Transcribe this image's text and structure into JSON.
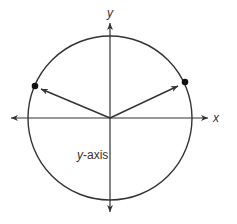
{
  "diagram": {
    "colors": {
      "stroke": "#333333",
      "point": "#111111",
      "background": "#ffffff"
    },
    "axes": {
      "x_label": "x",
      "y_label": "y"
    },
    "circle": {
      "center": [
        110,
        118
      ],
      "radius": 82
    },
    "points": [
      {
        "name": "right-point",
        "position": [
          185,
          82
        ],
        "quadrant": "I"
      },
      {
        "name": "left-point",
        "position": [
          35,
          86
        ],
        "quadrant": "II"
      }
    ],
    "vectors": [
      {
        "name": "vector-to-right-point",
        "from": [
          110,
          118
        ],
        "to": [
          178,
          86
        ]
      },
      {
        "name": "vector-to-left-point",
        "from": [
          110,
          118
        ],
        "to": [
          41,
          89
        ]
      }
    ],
    "annotation": {
      "var": "y",
      "suffix": "-axis"
    }
  }
}
